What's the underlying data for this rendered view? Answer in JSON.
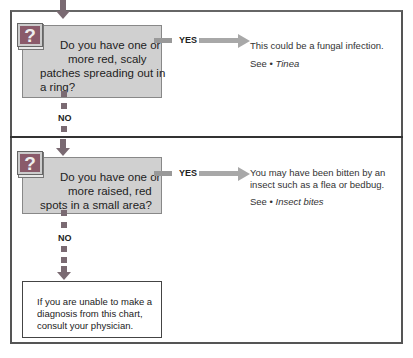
{
  "colors": {
    "question_bg": "#d0d0d0",
    "answer_bg": "#e4e4e4",
    "connector": "#7a6a72",
    "yes_arrow": "#a8a8a8",
    "icon_bg": "#8a5a6a"
  },
  "steps": [
    {
      "icon": "question-mark-icon",
      "icon_glyph": "?",
      "question": [
        "Do you have one or",
        "more red, scaly",
        "patches spreading out in",
        "a ring?"
      ],
      "yes_label": "YES",
      "no_label": "NO",
      "answer": {
        "text": "This could be a fungal infection.",
        "see_prefix": "See • ",
        "see_link": "Tinea"
      }
    },
    {
      "icon": "question-mark-icon",
      "icon_glyph": "?",
      "question": [
        "Do you have one or",
        "more raised, red",
        "spots in a small area?"
      ],
      "yes_label": "YES",
      "no_label": "NO",
      "answer": {
        "text_lines": [
          "You may have been bitten by an",
          "insect such as a flea or bedbug."
        ],
        "see_prefix": "See • ",
        "see_link": "Insect bites"
      }
    }
  ],
  "final": {
    "lines": [
      "If you are unable to make a",
      "diagnosis from this chart,",
      "consult your physician."
    ]
  }
}
